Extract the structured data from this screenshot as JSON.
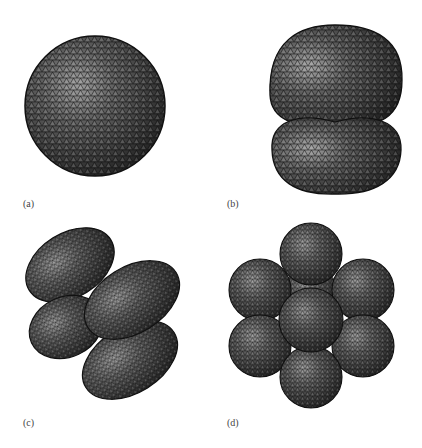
{
  "figure": {
    "panels": [
      {
        "id": "a",
        "label": "(a)",
        "shape": "single sphere"
      },
      {
        "id": "b",
        "label": "(b)",
        "shape": "two stacked lobes"
      },
      {
        "id": "c",
        "label": "(c)",
        "shape": "four ellipsoidal lobes"
      },
      {
        "id": "d",
        "label": "(d)",
        "shape": "cluster of spheres"
      }
    ],
    "colors": {
      "background": "#ffffff",
      "surface_dark": "#2a2a2a",
      "surface_mid": "#5a5a5a",
      "surface_highlight": "#b0b0b0",
      "mesh_line": "#111111",
      "label_text": "#444444"
    }
  }
}
